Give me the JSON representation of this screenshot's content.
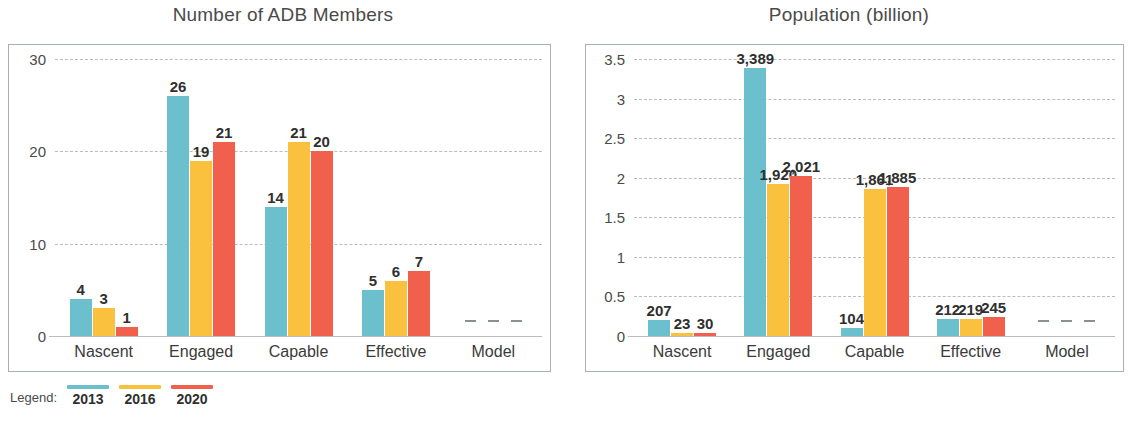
{
  "legend": {
    "caption": "Legend:",
    "items": [
      {
        "year": "2013",
        "color": "#6CC0CE"
      },
      {
        "year": "2016",
        "color": "#F9C13D"
      },
      {
        "year": "2020",
        "color": "#F1604C"
      }
    ]
  },
  "charts": [
    {
      "id": "adb-members",
      "chart_data": {
        "type": "bar",
        "title": "Number of ADB Members",
        "xlabel": "",
        "ylabel": "",
        "ylim": [
          0,
          30
        ],
        "yticks": [
          "0",
          "10",
          "20",
          "30"
        ],
        "grid": true,
        "legend_position": "below-figure",
        "categories": [
          "Nascent",
          "Engaged",
          "Capable",
          "Effective",
          "Model"
        ],
        "series": [
          {
            "name": "2013",
            "color": "#6CC0CE",
            "values": [
              4,
              26,
              14,
              5,
              0
            ],
            "labels": [
              "4",
              "26",
              "14",
              "5",
              "–"
            ]
          },
          {
            "name": "2016",
            "color": "#F9C13D",
            "values": [
              3,
              19,
              21,
              6,
              0
            ],
            "labels": [
              "3",
              "19",
              "21",
              "6",
              "–"
            ]
          },
          {
            "name": "2020",
            "color": "#F1604C",
            "values": [
              1,
              21,
              20,
              7,
              0
            ],
            "labels": [
              "1",
              "21",
              "20",
              "7",
              "–"
            ]
          }
        ]
      }
    },
    {
      "id": "population",
      "chart_data": {
        "type": "bar",
        "title": "Population (billion)",
        "xlabel": "",
        "ylabel": "",
        "ylim": [
          0,
          3.5
        ],
        "yticks": [
          "0",
          "0.5",
          "1",
          "1.5",
          "2",
          "2.5",
          "3",
          "3.5"
        ],
        "grid": true,
        "legend_position": "below-figure",
        "categories": [
          "Nascent",
          "Engaged",
          "Capable",
          "Effective",
          "Model"
        ],
        "series": [
          {
            "name": "2013",
            "color": "#6CC0CE",
            "values": [
              0.207,
              3.389,
              0.104,
              0.212,
              0
            ],
            "labels": [
              "207",
              "3,389",
              "104",
              "212",
              "–"
            ]
          },
          {
            "name": "2016",
            "color": "#F9C13D",
            "values": [
              0.023,
              1.92,
              1.861,
              0.219,
              0
            ],
            "labels": [
              "23",
              "1,920",
              "1,861",
              "219",
              "–"
            ]
          },
          {
            "name": "2020",
            "color": "#F1604C",
            "values": [
              0.03,
              2.021,
              1.885,
              0.245,
              0
            ],
            "labels": [
              "30",
              "2,021",
              "1,885",
              "245",
              "–"
            ]
          }
        ]
      }
    }
  ]
}
